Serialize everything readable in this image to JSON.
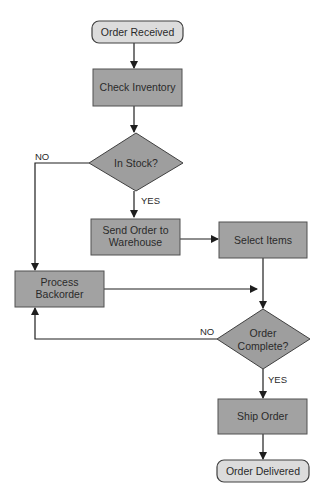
{
  "diagram": {
    "type": "flowchart",
    "nodes": {
      "order_received": {
        "label": "Order Received",
        "shape": "terminator"
      },
      "check_inventory": {
        "label": "Check Inventory",
        "shape": "process"
      },
      "in_stock": {
        "label": "In Stock?",
        "shape": "decision"
      },
      "send_order": {
        "line1": "Send Order to",
        "line2": "Warehouse",
        "shape": "process"
      },
      "select_items": {
        "label": "Select Items",
        "shape": "process"
      },
      "process_backorder": {
        "line1": "Process",
        "line2": "Backorder",
        "shape": "process"
      },
      "order_complete": {
        "line1": "Order",
        "line2": "Complete?",
        "shape": "decision"
      },
      "ship_order": {
        "label": "Ship Order",
        "shape": "process"
      },
      "order_delivered": {
        "label": "Order Delivered",
        "shape": "terminator"
      }
    },
    "edge_labels": {
      "in_stock_no": "NO",
      "in_stock_yes": "YES",
      "order_complete_no": "NO",
      "order_complete_yes": "YES"
    },
    "edges": [
      {
        "from": "Order Received",
        "to": "Check Inventory"
      },
      {
        "from": "Check Inventory",
        "to": "In Stock?"
      },
      {
        "from": "In Stock?",
        "to": "Send Order to Warehouse",
        "label": "YES"
      },
      {
        "from": "In Stock?",
        "to": "Process Backorder",
        "label": "NO"
      },
      {
        "from": "Send Order to Warehouse",
        "to": "Select Items"
      },
      {
        "from": "Select Items",
        "to": "Order Complete?"
      },
      {
        "from": "Process Backorder",
        "to": "Order Complete?"
      },
      {
        "from": "Order Complete?",
        "to": "Process Backorder",
        "label": "NO"
      },
      {
        "from": "Order Complete?",
        "to": "Ship Order",
        "label": "YES"
      },
      {
        "from": "Ship Order",
        "to": "Order Delivered"
      }
    ],
    "colors": {
      "process_fill": "#a2a2a2",
      "terminator_fill": "#dcdcdc",
      "decision_fill": "#9e9e9e",
      "stroke": "#404040"
    }
  }
}
